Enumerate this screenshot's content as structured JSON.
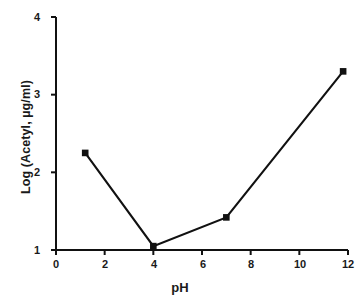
{
  "chart_data": {
    "type": "line",
    "title": "",
    "xlabel": "pH",
    "ylabel": "Log (Acetyl, µg/ml)",
    "xlim": [
      0,
      12
    ],
    "ylim": [
      1,
      4
    ],
    "xticks": [
      "0",
      "2",
      "4",
      "6",
      "8",
      "10",
      "12"
    ],
    "xtick_values": [
      0,
      2,
      4,
      6,
      8,
      10,
      12
    ],
    "yticks": [
      "1",
      "2",
      "3",
      "4"
    ],
    "ytick_values": [
      1,
      2,
      3,
      4
    ],
    "grid": false,
    "legend": null,
    "marker": "filled-square",
    "line_color": "#111111",
    "series": [
      {
        "name": "Log (Acetyl)",
        "x": [
          1.2,
          4.0,
          7.0,
          11.8
        ],
        "y": [
          2.25,
          1.05,
          1.42,
          3.3
        ]
      }
    ]
  }
}
